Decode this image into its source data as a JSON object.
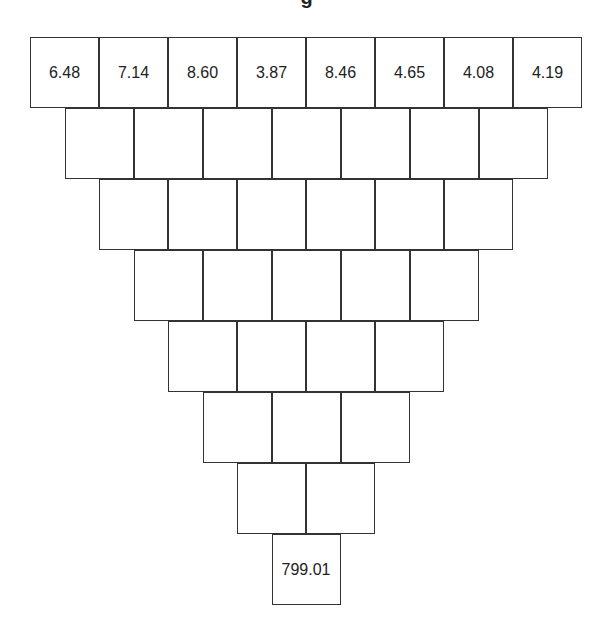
{
  "title": "g",
  "pyramid": {
    "rows": [
      [
        "6.48",
        "7.14",
        "8.60",
        "3.87",
        "8.46",
        "4.65",
        "4.08",
        "4.19"
      ],
      [
        "",
        "",
        "",
        "",
        "",
        "",
        ""
      ],
      [
        "",
        "",
        "",
        "",
        "",
        ""
      ],
      [
        "",
        "",
        "",
        "",
        ""
      ],
      [
        "",
        "",
        "",
        ""
      ],
      [
        "",
        "",
        ""
      ],
      [
        "",
        ""
      ],
      [
        "799.01"
      ]
    ]
  },
  "colors": {
    "border": "#333333",
    "background": "#ffffff",
    "text": "#222222"
  }
}
